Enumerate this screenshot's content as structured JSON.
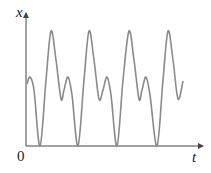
{
  "figure": {
    "y_axis_label": "x",
    "x_axis_label": "t",
    "origin_label": "0",
    "curve_color": "#8a8a8a",
    "axis_color": "#444444"
  },
  "chart_data": {
    "type": "line",
    "title": "",
    "xlabel": "t",
    "ylabel": "x",
    "grid": false,
    "series": [
      {
        "name": "x(t)",
        "points_px": [
          [
            27,
            84
          ],
          [
            30,
            77
          ],
          [
            34,
            90
          ],
          [
            40,
            146
          ],
          [
            46,
            80
          ],
          [
            51,
            31
          ],
          [
            56,
            60
          ],
          [
            61,
            99
          ],
          [
            64,
            90
          ],
          [
            68,
            77
          ],
          [
            72,
            95
          ],
          [
            78,
            146
          ],
          [
            84,
            80
          ],
          [
            89,
            31
          ],
          [
            94,
            60
          ],
          [
            99,
            99
          ],
          [
            103,
            90
          ],
          [
            107,
            77
          ],
          [
            111,
            95
          ],
          [
            117,
            146
          ],
          [
            123,
            80
          ],
          [
            129,
            31
          ],
          [
            134,
            60
          ],
          [
            139,
            99
          ],
          [
            142,
            90
          ],
          [
            146,
            77
          ],
          [
            150,
            95
          ],
          [
            157,
            146
          ],
          [
            163,
            80
          ],
          [
            168,
            31
          ],
          [
            173,
            60
          ],
          [
            178,
            99
          ],
          [
            183,
            81
          ]
        ]
      }
    ]
  }
}
